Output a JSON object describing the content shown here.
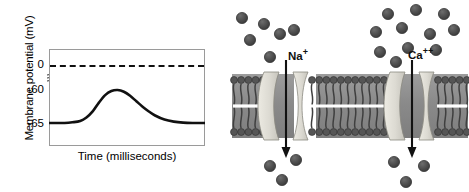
{
  "figure": {
    "panels": [
      "chart",
      "membrane-diagram"
    ]
  },
  "chart_data": {
    "type": "line",
    "title": "",
    "xlabel": "Time (milliseconds)",
    "ylabel": "Membrane potential (mV)",
    "ytick_labels": [
      "0",
      "-60",
      "-65"
    ],
    "ytick_values": [
      0,
      -60,
      -65
    ],
    "ylim": [
      -66.5,
      2
    ],
    "xlim": [
      0,
      100
    ],
    "axis_break": true,
    "axis_break_between": [
      0,
      -60
    ],
    "grid": false,
    "legend": false,
    "reference_lines": [
      {
        "name": "zero-mV-dashed-line",
        "value": 0,
        "style": "dashed",
        "color": "#111111"
      }
    ],
    "series": [
      {
        "name": "membrane-potential",
        "color": "#111111",
        "x": [
          0,
          5,
          10,
          15,
          20,
          24,
          28,
          32,
          36,
          40,
          44,
          48,
          52,
          56,
          60,
          64,
          68,
          74,
          80,
          86,
          92,
          100
        ],
        "y": [
          -65.0,
          -65.0,
          -65.0,
          -64.9,
          -64.7,
          -64.2,
          -63.3,
          -62.0,
          -60.9,
          -60.3,
          -60.15,
          -60.4,
          -61.0,
          -61.8,
          -62.6,
          -63.3,
          -63.9,
          -64.5,
          -64.8,
          -64.95,
          -65.0,
          -65.0
        ]
      }
    ]
  },
  "membrane_diagram": {
    "name": "lipid-bilayer-with-ion-channels",
    "labels": {
      "sodium": {
        "element": "Na",
        "charge": "+"
      },
      "calcium": {
        "element": "Ca",
        "charge": "++"
      }
    },
    "channels": [
      {
        "name": "sodium-channel",
        "ion": "Na+",
        "flow": "inward"
      },
      {
        "name": "calcium-channel",
        "ion": "Ca++",
        "flow": "inward"
      }
    ],
    "ion_counts": {
      "sodium_extracellular": 6,
      "sodium_intracellular": 3,
      "calcium_extracellular": 11,
      "calcium_intracellular": 3
    },
    "colors": {
      "ion": "#4a4a4a",
      "membrane_core": "#8e8e8e",
      "channel_protein": "#d8d8d2",
      "lipid_head": "#555555",
      "background": "#ffffff"
    }
  }
}
